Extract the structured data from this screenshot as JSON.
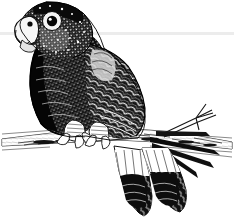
{
  "canvas": {
    "width": 234,
    "height": 221,
    "background_color": "#ffffff",
    "ink_color": "#111111",
    "rule_color": "#ececec",
    "style": "black-and-white pen-and-ink engraving / scratchboard illustration"
  },
  "divider": {
    "label": "horizontal rule",
    "color": "#ececec",
    "y": 33,
    "x_start": 0,
    "x_end": 234,
    "thickness": 3
  },
  "illustration": {
    "subject": "parrot perched on a branch",
    "title": "Parrot on branch",
    "orientation": "facing left",
    "parts": [
      {
        "name": "head",
        "label": "Head",
        "note": "speckled dark crown and cheek feathers"
      },
      {
        "name": "beak",
        "label": "Beak",
        "note": "pale hooked upper mandible"
      },
      {
        "name": "eye",
        "label": "Eye",
        "note": "dark pupil inside pale eye-ring"
      },
      {
        "name": "breast",
        "label": "Breast",
        "note": "very dark with light speckling"
      },
      {
        "name": "wing",
        "label": "Wing",
        "note": "scalloped overlapping feathers with light edges"
      },
      {
        "name": "feet",
        "label": "Feet",
        "note": "zygodactyl toes gripping the branch"
      },
      {
        "name": "tail",
        "label": "Tail",
        "note": "long feathers hanging down and to the right"
      },
      {
        "name": "branch",
        "label": "Branch",
        "note": "horizontal limb with a forked twig at right"
      }
    ]
  }
}
